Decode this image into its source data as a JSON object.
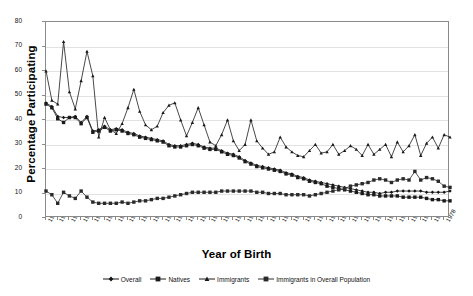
{
  "chart_data": {
    "type": "line",
    "title": "",
    "xlabel": "Year of Birth",
    "ylabel": "Percentage Participating",
    "xlim": [
      1910,
      1979
    ],
    "ylim": [
      0,
      80
    ],
    "yticks": [
      0,
      10,
      20,
      30,
      40,
      50,
      60,
      70,
      80
    ],
    "grid": true,
    "legend_position": "bottom",
    "x": [
      1910,
      1911,
      1912,
      1913,
      1914,
      1915,
      1916,
      1917,
      1918,
      1919,
      1920,
      1921,
      1922,
      1923,
      1924,
      1925,
      1926,
      1927,
      1928,
      1929,
      1930,
      1931,
      1932,
      1933,
      1934,
      1935,
      1936,
      1937,
      1938,
      1939,
      1940,
      1941,
      1942,
      1943,
      1944,
      1945,
      1946,
      1947,
      1948,
      1949,
      1950,
      1951,
      1952,
      1953,
      1954,
      1955,
      1956,
      1957,
      1958,
      1959,
      1960,
      1961,
      1962,
      1963,
      1964,
      1965,
      1966,
      1967,
      1968,
      1969,
      1970,
      1971,
      1972,
      1973,
      1974,
      1975,
      1976,
      1977,
      1978,
      1979
    ],
    "xtick_labels": [
      "1910",
      "1912",
      "1914",
      "1916",
      "1918",
      "1920",
      "1922",
      "1924",
      "1926",
      "1928",
      "1930",
      "1932",
      "1934",
      "1936",
      "1938",
      "1940",
      "1942",
      "1944",
      "1946",
      "1948",
      "1950",
      "1952",
      "1954",
      "1956",
      "1958",
      "1960",
      "1962",
      "1964",
      "1966",
      "1968",
      "1970",
      "1972",
      "1974",
      "1976",
      "1978"
    ],
    "series": [
      {
        "name": "Overall",
        "marker": "diamond",
        "color": "#141414",
        "values": [
          47.0,
          45.5,
          41.5,
          41.0,
          41.0,
          41.5,
          39.0,
          41.5,
          35.5,
          36.0,
          37.5,
          36.0,
          36.5,
          36.0,
          35.0,
          34.5,
          33.5,
          33.0,
          32.5,
          32.0,
          31.5,
          30.0,
          29.5,
          29.5,
          30.0,
          30.5,
          30.0,
          29.0,
          28.5,
          28.5,
          27.5,
          26.5,
          26.0,
          25.0,
          23.5,
          22.5,
          21.5,
          21.0,
          20.5,
          20.0,
          19.5,
          18.5,
          18.0,
          17.0,
          16.5,
          15.5,
          15.0,
          14.5,
          14.0,
          13.5,
          13.0,
          12.5,
          12.0,
          11.5,
          11.0,
          10.5,
          10.5,
          10.0,
          10.5,
          10.5,
          11.0,
          11.0,
          11.0,
          11.0,
          11.0,
          10.5,
          10.5,
          10.5,
          10.5,
          11.0
        ]
      },
      {
        "name": "Natives",
        "marker": "square",
        "color": "#1a1a1a",
        "values": [
          46.5,
          45.0,
          40.5,
          39.0,
          41.0,
          41.0,
          38.5,
          41.0,
          35.0,
          35.5,
          37.0,
          35.5,
          36.0,
          35.5,
          34.5,
          34.0,
          33.0,
          32.5,
          32.0,
          31.5,
          31.0,
          29.5,
          29.0,
          29.0,
          29.5,
          30.0,
          29.5,
          28.5,
          28.0,
          28.0,
          27.0,
          26.0,
          25.5,
          24.5,
          23.0,
          22.0,
          21.0,
          20.5,
          20.0,
          19.5,
          19.0,
          18.0,
          17.5,
          16.5,
          16.0,
          15.0,
          14.5,
          14.0,
          13.0,
          12.5,
          12.0,
          11.5,
          11.0,
          10.5,
          10.0,
          9.5,
          9.5,
          9.0,
          9.0,
          9.0,
          9.0,
          8.5,
          8.5,
          8.5,
          8.5,
          8.0,
          7.5,
          7.5,
          7.0,
          7.0
        ]
      },
      {
        "name": "Immigrants",
        "marker": "triangle",
        "color": "#1a1a1a",
        "values": [
          60.0,
          48.0,
          46.5,
          72.0,
          51.5,
          44.5,
          56.0,
          68.0,
          58.0,
          33.0,
          41.0,
          36.0,
          34.5,
          38.5,
          45.0,
          52.5,
          43.5,
          38.0,
          36.0,
          37.5,
          43.0,
          46.0,
          47.0,
          40.0,
          33.5,
          39.0,
          45.0,
          38.0,
          31.0,
          29.5,
          34.0,
          40.0,
          31.5,
          27.5,
          30.0,
          40.0,
          31.5,
          28.5,
          26.0,
          27.0,
          33.0,
          29.0,
          27.0,
          25.5,
          25.0,
          27.5,
          30.0,
          26.5,
          27.0,
          30.0,
          26.0,
          27.5,
          29.5,
          28.0,
          25.5,
          30.0,
          26.0,
          28.0,
          30.0,
          25.0,
          31.0,
          27.0,
          29.5,
          34.0,
          25.5,
          30.5,
          33.0,
          28.5,
          34.0,
          33.0
        ]
      },
      {
        "name": "Immigrants in Overall Population",
        "marker": "square",
        "color": "#2a2a2a",
        "values": [
          11.0,
          9.5,
          6.0,
          10.5,
          9.0,
          8.0,
          11.0,
          8.5,
          6.5,
          6.0,
          6.0,
          6.0,
          6.0,
          6.5,
          6.0,
          6.5,
          7.0,
          7.0,
          7.5,
          8.0,
          8.0,
          8.5,
          9.0,
          9.5,
          10.0,
          10.5,
          10.5,
          10.5,
          10.5,
          10.5,
          11.0,
          11.0,
          11.0,
          11.0,
          11.0,
          11.0,
          10.5,
          10.5,
          10.0,
          10.0,
          10.0,
          9.5,
          9.5,
          9.5,
          9.5,
          9.0,
          9.5,
          10.0,
          10.5,
          11.0,
          11.5,
          12.0,
          13.0,
          13.5,
          14.0,
          14.5,
          15.5,
          16.0,
          15.5,
          14.5,
          15.5,
          16.0,
          15.5,
          19.0,
          15.5,
          16.5,
          16.0,
          15.0,
          13.0,
          12.5
        ]
      }
    ]
  },
  "legend": {
    "items": [
      {
        "label": "Overall"
      },
      {
        "label": "Natives"
      },
      {
        "label": "Immigrants"
      },
      {
        "label": "Immigrants in Overall Population"
      }
    ]
  }
}
